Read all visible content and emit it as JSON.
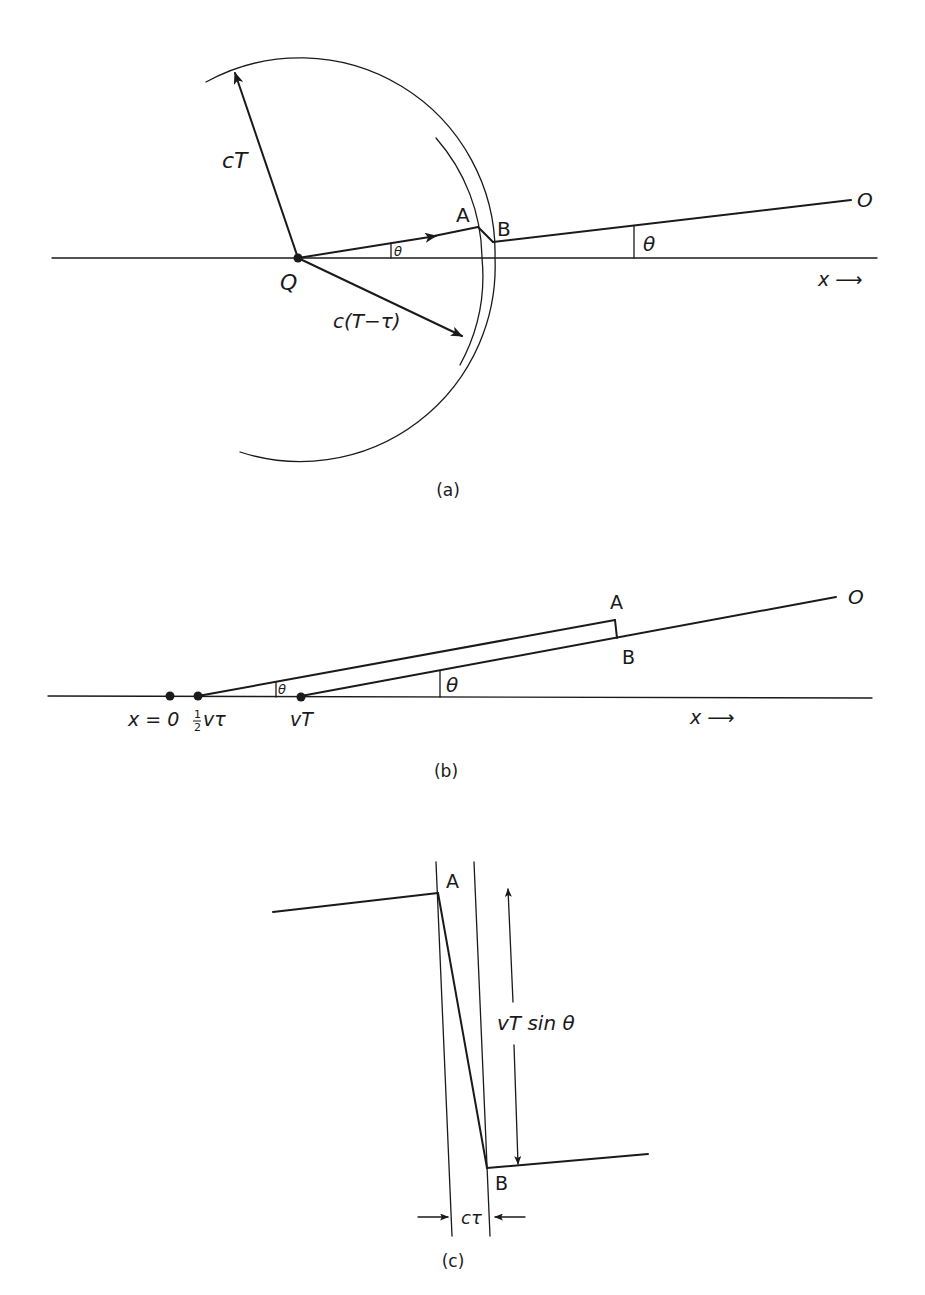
{
  "figure": {
    "panels": [
      {
        "id": "a",
        "caption": "(a)",
        "labels": {
          "radius_outer": "cT",
          "radius_inner": "c(T−τ)",
          "origin": "Q",
          "point_a": "A",
          "point_b": "B",
          "observer": "O",
          "angle_small": "θ",
          "angle_large": "θ",
          "axis": "x ⟶"
        }
      },
      {
        "id": "b",
        "caption": "(b)",
        "labels": {
          "origin_point": "x = 0",
          "half_point_num": "1",
          "half_point_den": "2",
          "half_point_expr": "vτ",
          "vt_point": "vT",
          "point_a": "A",
          "point_b": "B",
          "observer": "O",
          "angle_small": "θ",
          "angle_large": "θ",
          "axis": "x ⟶"
        }
      },
      {
        "id": "c",
        "caption": "(c)",
        "labels": {
          "point_a": "A",
          "point_b": "B",
          "height": "vT sin θ",
          "width": "cτ"
        }
      }
    ]
  }
}
